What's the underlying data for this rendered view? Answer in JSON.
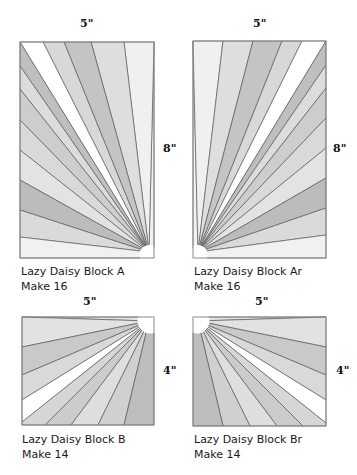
{
  "blocks": [
    {
      "id": "A",
      "title": "Lazy Daisy Block A",
      "quantity": "Make 16",
      "width_label": "5\"",
      "height_label": "8\"",
      "width_in": 5,
      "height_in": 8
    },
    {
      "id": "Ar",
      "title": "Lazy Daisy Block Ar",
      "quantity": "Make 16",
      "width_label": "5\"",
      "height_label": "8\"",
      "width_in": 5,
      "height_in": 8
    },
    {
      "id": "B",
      "title": "Lazy Daisy Block B",
      "quantity": "Make 14",
      "width_label": "5\"",
      "height_label": "4\"",
      "width_in": 5,
      "height_in": 4
    },
    {
      "id": "Br",
      "title": "Lazy Daisy Block Br",
      "quantity": "Make 14",
      "width_label": "5\"",
      "height_label": "4\"",
      "width_in": 5,
      "height_in": 4
    }
  ],
  "colors": {
    "outline": "#8a8a8a",
    "ray_line": "#4a4a4a",
    "white": "#ffffff",
    "very_light": "#f0f0f0",
    "light": "#e0e0e0",
    "mid_light": "#d4d4d4",
    "mid": "#c6c6c6",
    "dark": "#b8b8b8"
  }
}
